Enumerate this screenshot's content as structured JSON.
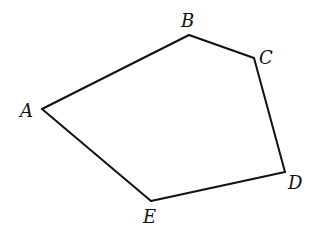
{
  "diagram": {
    "type": "pentagon",
    "stroke_color": "#111111",
    "background": "#ffffff",
    "vertices": [
      {
        "name": "A",
        "x": 42,
        "y": 109,
        "label_x": 20,
        "label_y": 117
      },
      {
        "name": "B",
        "x": 189,
        "y": 35,
        "label_x": 181,
        "label_y": 27
      },
      {
        "name": "C",
        "x": 254,
        "y": 58,
        "label_x": 259,
        "label_y": 64
      },
      {
        "name": "D",
        "x": 285,
        "y": 172,
        "label_x": 288,
        "label_y": 189
      },
      {
        "name": "E",
        "x": 151,
        "y": 201,
        "label_x": 143,
        "label_y": 223
      }
    ],
    "edges": [
      {
        "from": "A",
        "to": "B"
      },
      {
        "from": "B",
        "to": "C"
      },
      {
        "from": "C",
        "to": "D"
      },
      {
        "from": "D",
        "to": "E"
      },
      {
        "from": "E",
        "to": "A"
      }
    ]
  }
}
